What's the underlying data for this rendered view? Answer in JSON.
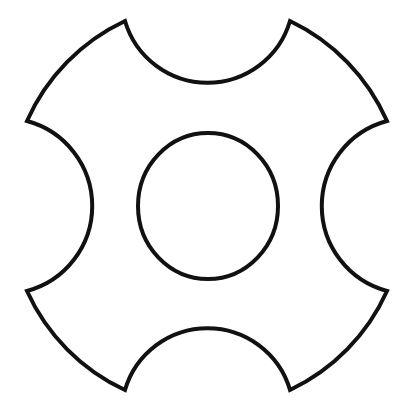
{
  "figure": {
    "description": "Line drawing of a rounded disc with four concave semicircular notches and a central circular hole",
    "stroke_color": "#111111",
    "fill_color": "#ffffff",
    "background": "#ffffff",
    "stroke_width": 4,
    "outer_shape": {
      "corners": [
        [
          125,
          21
        ],
        [
          290,
          21
        ],
        [
          387,
          121
        ],
        [
          387,
          291
        ],
        [
          290,
          390
        ],
        [
          125,
          390
        ],
        [
          27,
          291
        ],
        [
          27,
          121
        ]
      ],
      "outer_arc_radius": 200,
      "notch_radius": 86
    },
    "inner_circle": {
      "cx": 208,
      "cy": 206,
      "rx": 70,
      "ry": 73
    }
  }
}
